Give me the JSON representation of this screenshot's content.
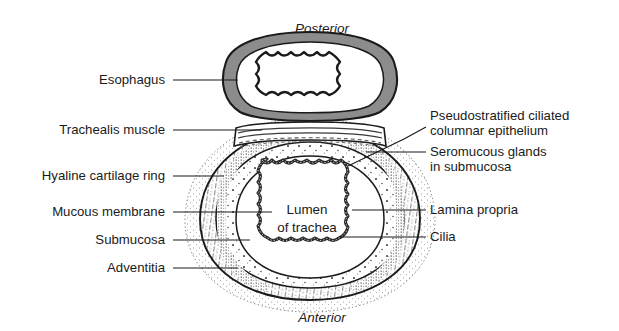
{
  "figure": {
    "kind": "anatomical-cross-section",
    "background_color": "#ffffff",
    "ink_color": "#1a1a1a"
  },
  "orientation": {
    "top_label": "Posterior",
    "bottom_label": "Anterior"
  },
  "center_label": {
    "line1": "Lumen",
    "line2": "of trachea"
  },
  "labels_left": [
    {
      "id": "esophagus",
      "text": "Esophagus",
      "text_x": 165,
      "text_y": 84,
      "line_y": 80,
      "end_x": 238,
      "end_y": 80
    },
    {
      "id": "trachealis-muscle",
      "text": "Trachealis muscle",
      "text_x": 165,
      "text_y": 134,
      "line_y": 130,
      "end_x": 262,
      "end_y": 130
    },
    {
      "id": "hyaline-cartilage",
      "text": "Hyaline cartilage ring",
      "text_x": 165,
      "text_y": 180,
      "line_y": 176,
      "end_x": 224,
      "end_y": 176
    },
    {
      "id": "mucous-membrane",
      "text": "Mucous membrane",
      "text_x": 165,
      "text_y": 216,
      "line_y": 212,
      "end_x": 272,
      "end_y": 212
    },
    {
      "id": "submucosa",
      "text": "Submucosa",
      "text_x": 165,
      "text_y": 244,
      "line_y": 240,
      "end_x": 250,
      "end_y": 240
    },
    {
      "id": "adventitia",
      "text": "Adventitia",
      "text_x": 165,
      "text_y": 272,
      "line_y": 268,
      "end_x": 238,
      "end_y": 268
    }
  ],
  "labels_right": [
    {
      "id": "epithelium",
      "lines": [
        "Pseudostratified ciliated",
        "columnar epithelium"
      ],
      "text_x": 430,
      "text_y": 120,
      "line_height": 15,
      "leader": "M 426 127 L 404 139 L 348 166"
    },
    {
      "id": "seromucous-glands",
      "lines": [
        "Seromucous glands",
        "in submucosa"
      ],
      "text_x": 430,
      "text_y": 156,
      "line_height": 15,
      "leader": "M 426 152 L 366 152"
    },
    {
      "id": "lamina-propria",
      "lines": [
        "Lamina propria"
      ],
      "text_x": 430,
      "text_y": 214,
      "line_height": 15,
      "leader": "M 426 210 L 352 210"
    },
    {
      "id": "cilia",
      "lines": [
        "Cilia"
      ],
      "text_x": 430,
      "text_y": 241,
      "line_height": 15,
      "leader": "M 426 237 L 340 237"
    }
  ],
  "structures": {
    "esophagus": {
      "name": "esophagus",
      "wall_fill": "#8c8c8c",
      "inner_band_fill": "#ffffff",
      "lumen_fill": "#ffffff",
      "outline_color": "#1a1a1a"
    },
    "trachea": {
      "name": "trachea",
      "adventitia_style": "fine dotted outline",
      "cartilage_style": "radial hatch stipple",
      "submucosa_style": "sparse dot stipple",
      "mucosa_style": "wavy dark epithelial border",
      "lumen_fill": "#ffffff",
      "outline_color": "#1a1a1a"
    }
  }
}
